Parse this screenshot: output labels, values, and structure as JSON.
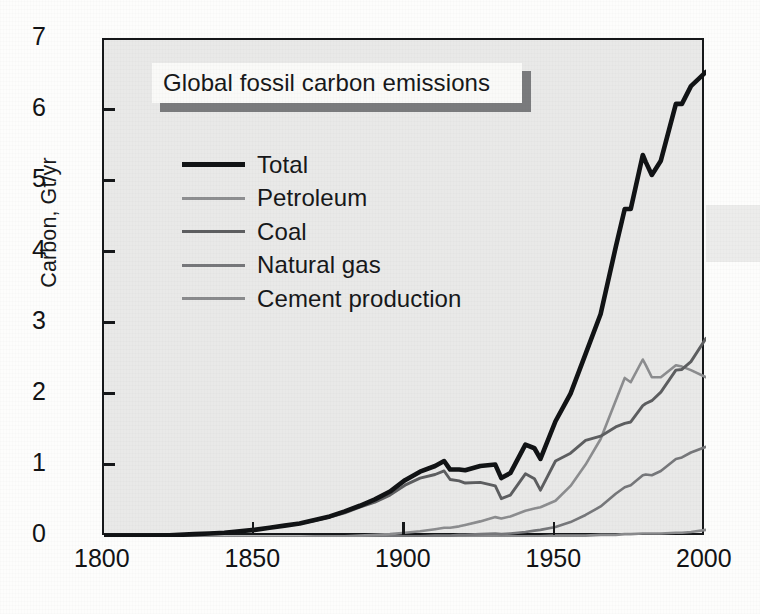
{
  "figure": {
    "title": "Global fossil carbon emissions",
    "background_color": "#fdfdfc",
    "plot_fill_color": "#e9e9e8",
    "frame_color": "#16181a"
  },
  "chart_data": {
    "type": "line",
    "title": "Global fossil carbon emissions",
    "xlabel": "",
    "ylabel": "Carbon, Gt/yr",
    "xlim": [
      1800,
      2000
    ],
    "ylim": [
      0,
      7
    ],
    "xticks": [
      1800,
      1850,
      1900,
      1950,
      2000
    ],
    "yticks": [
      0,
      1,
      2,
      3,
      4,
      5,
      6,
      7
    ],
    "grid": false,
    "legend_position": "upper-left",
    "x": [
      1800,
      1805,
      1810,
      1815,
      1820,
      1825,
      1830,
      1835,
      1840,
      1845,
      1850,
      1855,
      1860,
      1865,
      1870,
      1875,
      1880,
      1885,
      1890,
      1895,
      1900,
      1905,
      1910,
      1913,
      1915,
      1918,
      1920,
      1925,
      1930,
      1932,
      1935,
      1940,
      1943,
      1945,
      1950,
      1955,
      1960,
      1965,
      1970,
      1973,
      1975,
      1979,
      1980,
      1982,
      1985,
      1990,
      1992,
      1995,
      2000
    ],
    "series": [
      {
        "name": "Total",
        "color": "#111315",
        "width": 4.6,
        "values": [
          0.01,
          0.01,
          0.01,
          0.01,
          0.02,
          0.03,
          0.04,
          0.05,
          0.06,
          0.08,
          0.1,
          0.13,
          0.16,
          0.19,
          0.24,
          0.29,
          0.36,
          0.44,
          0.53,
          0.64,
          0.8,
          0.92,
          1.0,
          1.07,
          0.95,
          0.95,
          0.94,
          1.0,
          1.02,
          0.83,
          0.9,
          1.3,
          1.25,
          1.1,
          1.63,
          2.02,
          2.58,
          3.14,
          4.08,
          4.62,
          4.62,
          5.38,
          5.28,
          5.1,
          5.3,
          6.1,
          6.1,
          6.35,
          6.55
        ]
      },
      {
        "name": "Petroleum",
        "color": "#8c8d8f",
        "width": 2.6,
        "values": [
          0,
          0,
          0,
          0,
          0,
          0,
          0,
          0,
          0,
          0,
          0,
          0,
          0.0,
          0.0,
          0.01,
          0.01,
          0.01,
          0.02,
          0.03,
          0.04,
          0.06,
          0.08,
          0.11,
          0.13,
          0.13,
          0.15,
          0.17,
          0.22,
          0.28,
          0.26,
          0.29,
          0.37,
          0.4,
          0.42,
          0.51,
          0.72,
          1.02,
          1.38,
          1.92,
          2.24,
          2.18,
          2.5,
          2.42,
          2.25,
          2.25,
          2.42,
          2.4,
          2.35,
          2.25
        ]
      },
      {
        "name": "Coal",
        "color": "#5d5e60",
        "width": 2.9,
        "values": [
          0.01,
          0.01,
          0.01,
          0.01,
          0.02,
          0.03,
          0.04,
          0.05,
          0.06,
          0.08,
          0.1,
          0.13,
          0.16,
          0.19,
          0.23,
          0.28,
          0.34,
          0.42,
          0.49,
          0.59,
          0.73,
          0.83,
          0.88,
          0.93,
          0.81,
          0.79,
          0.76,
          0.77,
          0.72,
          0.54,
          0.59,
          0.89,
          0.82,
          0.66,
          1.07,
          1.18,
          1.36,
          1.42,
          1.55,
          1.6,
          1.62,
          1.85,
          1.88,
          1.92,
          2.04,
          2.35,
          2.36,
          2.47,
          2.8
        ]
      },
      {
        "name": "Natural gas",
        "color": "#76777a",
        "width": 2.6,
        "values": [
          0,
          0,
          0,
          0,
          0,
          0,
          0,
          0,
          0,
          0,
          0,
          0,
          0,
          0,
          0,
          0,
          0.0,
          0.0,
          0.0,
          0.01,
          0.01,
          0.01,
          0.02,
          0.02,
          0.02,
          0.03,
          0.03,
          0.04,
          0.05,
          0.04,
          0.05,
          0.07,
          0.09,
          0.1,
          0.14,
          0.21,
          0.31,
          0.43,
          0.61,
          0.7,
          0.73,
          0.87,
          0.88,
          0.87,
          0.93,
          1.1,
          1.12,
          1.19,
          1.27
        ]
      },
      {
        "name": "Cement production",
        "color": "#8a8b8d",
        "width": 2.6,
        "values": [
          0,
          0,
          0,
          0,
          0,
          0,
          0,
          0,
          0,
          0,
          0,
          0,
          0,
          0,
          0.0,
          0.0,
          0.0,
          0.0,
          0.0,
          0.0,
          0.0,
          0.0,
          0.0,
          0.01,
          0.01,
          0.01,
          0.01,
          0.01,
          0.01,
          0.01,
          0.01,
          0.01,
          0.01,
          0.01,
          0.02,
          0.02,
          0.02,
          0.03,
          0.03,
          0.04,
          0.04,
          0.05,
          0.05,
          0.05,
          0.05,
          0.06,
          0.06,
          0.07,
          0.1
        ]
      }
    ]
  },
  "axes": {
    "y_label": "Carbon, Gt/yr",
    "y_ticks": [
      "7",
      "6",
      "5",
      "4",
      "3",
      "2",
      "1",
      "0"
    ],
    "x_ticks": [
      "1800",
      "1850",
      "1900",
      "1950",
      "2000"
    ]
  },
  "legend": {
    "items": [
      {
        "label": "Total",
        "color": "#111315",
        "thickness": "5px"
      },
      {
        "label": "Petroleum",
        "color": "#8e8f91",
        "thickness": "3px"
      },
      {
        "label": "Coal",
        "color": "#5d5e60",
        "thickness": "3.5px"
      },
      {
        "label": "Natural gas",
        "color": "#76777a",
        "thickness": "3px"
      },
      {
        "label": "Cement production",
        "color": "#8a8b8d",
        "thickness": "3px"
      }
    ]
  }
}
